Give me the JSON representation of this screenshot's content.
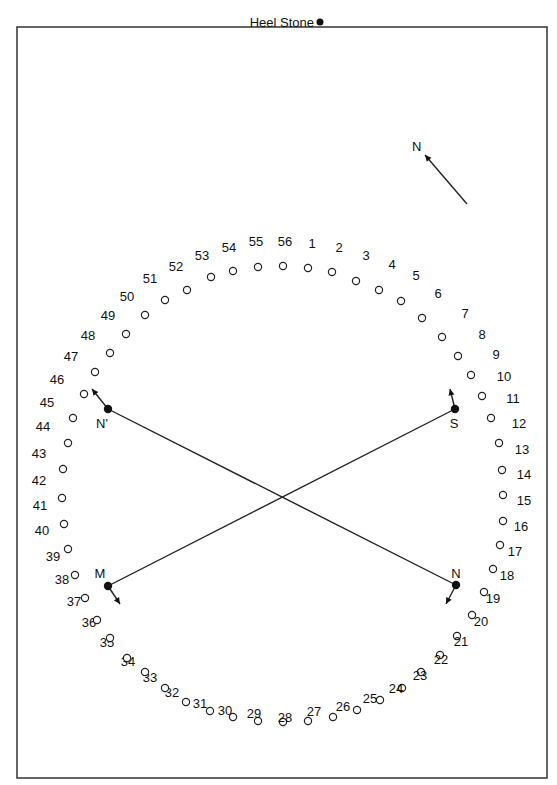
{
  "heel_stone": {
    "label": "Heel Stone",
    "x": 320,
    "y": 22
  },
  "north_arrow": {
    "label": "N",
    "x1": 467,
    "y1": 204,
    "x2": 425,
    "y2": 155
  },
  "stations": [
    {
      "label": "N'",
      "x": 108,
      "y": 409,
      "lx": 102,
      "ly": 428,
      "ax": 92,
      "ay": 389
    },
    {
      "label": "S",
      "x": 455,
      "y": 409,
      "lx": 454,
      "ly": 428,
      "ax": 450,
      "ay": 389
    },
    {
      "label": "M",
      "x": 108,
      "y": 586,
      "lx": 100,
      "ly": 578,
      "ax": 120,
      "ay": 604
    },
    {
      "label": "N",
      "x": 456,
      "y": 585,
      "lx": 456,
      "ly": 578,
      "ax": 446,
      "ay": 604
    }
  ],
  "lines": [
    {
      "from": "N'",
      "to": "N"
    },
    {
      "from": "M",
      "to": "S"
    }
  ],
  "holes": [
    {
      "n": "1",
      "x": 308,
      "y": 268,
      "lx": 312,
      "ly": 248
    },
    {
      "n": "2",
      "x": 332,
      "y": 272,
      "lx": 339,
      "ly": 252
    },
    {
      "n": "3",
      "x": 356,
      "y": 281,
      "lx": 366,
      "ly": 260
    },
    {
      "n": "4",
      "x": 379,
      "y": 290,
      "lx": 392,
      "ly": 269
    },
    {
      "n": "5",
      "x": 401,
      "y": 301,
      "lx": 416,
      "ly": 280
    },
    {
      "n": "6",
      "x": 422,
      "y": 318,
      "lx": 438,
      "ly": 298
    },
    {
      "n": "7",
      "x": 442,
      "y": 337,
      "lx": 465,
      "ly": 318
    },
    {
      "n": "8",
      "x": 458,
      "y": 356,
      "lx": 482,
      "ly": 339
    },
    {
      "n": "9",
      "x": 471,
      "y": 375,
      "lx": 496,
      "ly": 359
    },
    {
      "n": "10",
      "x": 482,
      "y": 396,
      "lx": 504,
      "ly": 381
    },
    {
      "n": "11",
      "x": 491,
      "y": 418,
      "lx": 513,
      "ly": 403
    },
    {
      "n": "12",
      "x": 499,
      "y": 443,
      "lx": 519,
      "ly": 428
    },
    {
      "n": "13",
      "x": 502,
      "y": 470,
      "lx": 522,
      "ly": 454
    },
    {
      "n": "14",
      "x": 503,
      "y": 495,
      "lx": 524,
      "ly": 479
    },
    {
      "n": "15",
      "x": 503,
      "y": 521,
      "lx": 524,
      "ly": 505
    },
    {
      "n": "16",
      "x": 500,
      "y": 545,
      "lx": 521,
      "ly": 531
    },
    {
      "n": "17",
      "x": 493,
      "y": 569,
      "lx": 515,
      "ly": 556
    },
    {
      "n": "18",
      "x": 484,
      "y": 592,
      "lx": 507,
      "ly": 580
    },
    {
      "n": "19",
      "x": 472,
      "y": 615,
      "lx": 493,
      "ly": 603
    },
    {
      "n": "20",
      "x": 457,
      "y": 636,
      "lx": 481,
      "ly": 626
    },
    {
      "n": "21",
      "x": 440,
      "y": 655,
      "lx": 461,
      "ly": 646
    },
    {
      "n": "22",
      "x": 421,
      "y": 672,
      "lx": 441,
      "ly": 664
    },
    {
      "n": "23",
      "x": 402,
      "y": 688,
      "lx": 420,
      "ly": 680
    },
    {
      "n": "24",
      "x": 380,
      "y": 700,
      "lx": 396,
      "ly": 693
    },
    {
      "n": "25",
      "x": 357,
      "y": 710,
      "lx": 370,
      "ly": 703
    },
    {
      "n": "26",
      "x": 333,
      "y": 717,
      "lx": 343,
      "ly": 711
    },
    {
      "n": "27",
      "x": 308,
      "y": 721,
      "lx": 314,
      "ly": 716
    },
    {
      "n": "28",
      "x": 283,
      "y": 722,
      "lx": 285,
      "ly": 722
    },
    {
      "n": "29",
      "x": 258,
      "y": 721,
      "lx": 254,
      "ly": 718
    },
    {
      "n": "30",
      "x": 233,
      "y": 717,
      "lx": 225,
      "ly": 715
    },
    {
      "n": "31",
      "x": 210,
      "y": 711,
      "lx": 200,
      "ly": 708
    },
    {
      "n": "32",
      "x": 186,
      "y": 702,
      "lx": 172,
      "ly": 697
    },
    {
      "n": "33",
      "x": 165,
      "y": 688,
      "lx": 150,
      "ly": 682
    },
    {
      "n": "34",
      "x": 145,
      "y": 672,
      "lx": 128,
      "ly": 666
    },
    {
      "n": "35",
      "x": 127,
      "y": 658,
      "lx": 107,
      "ly": 647
    },
    {
      "n": "36",
      "x": 110,
      "y": 638,
      "lx": 89,
      "ly": 627
    },
    {
      "n": "37",
      "x": 97,
      "y": 620,
      "lx": 74,
      "ly": 606
    },
    {
      "n": "38",
      "x": 85,
      "y": 598,
      "lx": 62,
      "ly": 584
    },
    {
      "n": "39",
      "x": 75,
      "y": 575,
      "lx": 53,
      "ly": 561
    },
    {
      "n": "40",
      "x": 68,
      "y": 549,
      "lx": 42,
      "ly": 535
    },
    {
      "n": "41",
      "x": 64,
      "y": 524,
      "lx": 40,
      "ly": 510
    },
    {
      "n": "42",
      "x": 62,
      "y": 498,
      "lx": 39,
      "ly": 485
    },
    {
      "n": "43",
      "x": 63,
      "y": 469,
      "lx": 39,
      "ly": 458
    },
    {
      "n": "44",
      "x": 68,
      "y": 443,
      "lx": 43,
      "ly": 431
    },
    {
      "n": "45",
      "x": 73,
      "y": 418,
      "lx": 47,
      "ly": 407
    },
    {
      "n": "46",
      "x": 84,
      "y": 394,
      "lx": 57,
      "ly": 384
    },
    {
      "n": "47",
      "x": 95,
      "y": 372,
      "lx": 71,
      "ly": 361
    },
    {
      "n": "48",
      "x": 110,
      "y": 353,
      "lx": 88,
      "ly": 340
    },
    {
      "n": "49",
      "x": 126,
      "y": 334,
      "lx": 108,
      "ly": 320
    },
    {
      "n": "50",
      "x": 145,
      "y": 315,
      "lx": 127,
      "ly": 301
    },
    {
      "n": "51",
      "x": 165,
      "y": 300,
      "lx": 150,
      "ly": 283
    },
    {
      "n": "52",
      "x": 187,
      "y": 290,
      "lx": 176,
      "ly": 271
    },
    {
      "n": "53",
      "x": 211,
      "y": 277,
      "lx": 202,
      "ly": 260
    },
    {
      "n": "54",
      "x": 233,
      "y": 271,
      "lx": 229,
      "ly": 252
    },
    {
      "n": "55",
      "x": 258,
      "y": 267,
      "lx": 256,
      "ly": 246
    },
    {
      "n": "56",
      "x": 283,
      "y": 266,
      "lx": 285,
      "ly": 246
    }
  ]
}
